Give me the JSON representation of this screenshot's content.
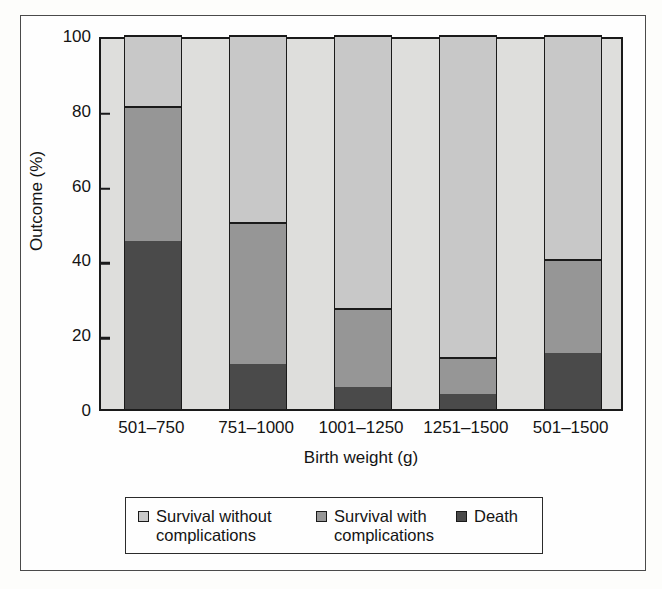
{
  "chart_data": {
    "type": "bar",
    "subtype": "stacked-100-percent",
    "title": "",
    "xlabel": "Birth weight (g)",
    "ylabel": "Outcome (%)",
    "categories": [
      "501–750",
      "751–1000",
      "1001–1250",
      "1251–1500",
      "501–1500"
    ],
    "ylim": [
      0,
      100
    ],
    "yticks": [
      0,
      20,
      40,
      60,
      80,
      100
    ],
    "ytick_labels": [
      "0",
      "20",
      "40",
      "60",
      "80",
      "100"
    ],
    "grid": false,
    "legend_position": "bottom",
    "stack_order_bottom_to_top": [
      "Death",
      "Survival with complications",
      "Survival without complications"
    ],
    "series": [
      {
        "name": "Death",
        "color": "#4a4a4a",
        "values": [
          45,
          12,
          6,
          4,
          15
        ]
      },
      {
        "name": "Survival with complications",
        "color": "#969696",
        "values": [
          36,
          38,
          21,
          10,
          25
        ]
      },
      {
        "name": "Survival without complications",
        "color": "#c8c8c8",
        "values": [
          19,
          50,
          73,
          86,
          60
        ]
      }
    ],
    "cumulative_tops": {
      "death": [
        45,
        12,
        6,
        4,
        15
      ],
      "death_plus_complications": [
        81,
        50,
        27,
        14,
        40
      ],
      "total": [
        100,
        100,
        100,
        100,
        100
      ]
    }
  },
  "legend": {
    "items": [
      {
        "label": "Survival without complications",
        "color": "#c8c8c8"
      },
      {
        "label": "Survival with complications",
        "color": "#969696"
      },
      {
        "label": "Death",
        "color": "#4a4a4a"
      }
    ]
  },
  "colors": {
    "survival_without": "#c8c8c8",
    "survival_with": "#969696",
    "death": "#4a4a4a",
    "plot_background": "#dededc",
    "axis": "#1a1a1a",
    "frame": "#4a4a4a"
  }
}
